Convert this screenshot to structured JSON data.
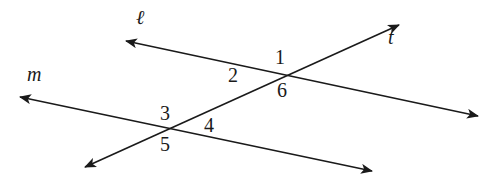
{
  "diagram": {
    "type": "parallel lines cut by a transversal",
    "lines": [
      {
        "name": "ℓ",
        "x1": 126,
        "y1": 41,
        "x2": 478,
        "y2": 116,
        "label_x": 136,
        "label_y": 24
      },
      {
        "name": "m",
        "x1": 20,
        "y1": 97,
        "x2": 372,
        "y2": 171,
        "label_x": 27,
        "label_y": 81
      },
      {
        "name": "t",
        "x1": 85,
        "y1": 167,
        "x2": 399,
        "y2": 25,
        "label_x": 388,
        "label_y": 44
      }
    ],
    "intersections": [
      {
        "lines": [
          "ℓ",
          "t"
        ],
        "x": 283,
        "y": 74
      },
      {
        "lines": [
          "m",
          "t"
        ],
        "x": 166,
        "y": 131
      }
    ],
    "angles": [
      {
        "label": "1",
        "x": 280,
        "y": 64
      },
      {
        "label": "2",
        "x": 233,
        "y": 82
      },
      {
        "label": "6",
        "x": 282,
        "y": 97
      },
      {
        "label": "3",
        "x": 165,
        "y": 120
      },
      {
        "label": "4",
        "x": 209,
        "y": 132
      },
      {
        "label": "5",
        "x": 165,
        "y": 151
      }
    ],
    "colors": {
      "stroke": "#1a1a1a",
      "background": "#ffffff"
    }
  }
}
